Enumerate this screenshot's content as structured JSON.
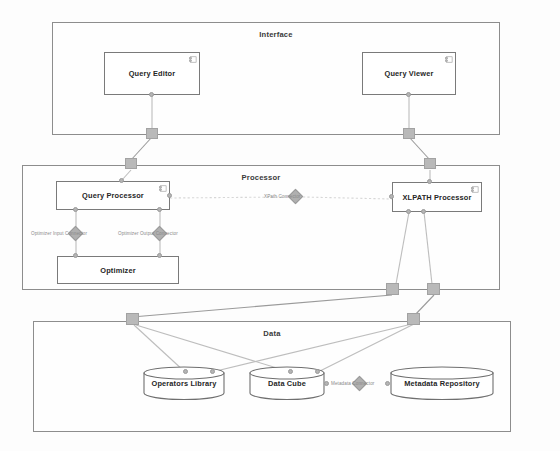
{
  "diagram": {
    "packages": [
      {
        "id": "interface",
        "label": "Interface"
      },
      {
        "id": "processor",
        "label": "Processor"
      },
      {
        "id": "data",
        "label": "Data"
      }
    ],
    "components": [
      {
        "id": "query-editor",
        "label": "Query Editor",
        "package": "interface"
      },
      {
        "id": "query-viewer",
        "label": "Query Viewer",
        "package": "interface"
      },
      {
        "id": "query-processor",
        "label": "Query Processor",
        "package": "processor"
      },
      {
        "id": "xlpath-processor",
        "label": "XLPATH Processor",
        "package": "processor"
      },
      {
        "id": "optimizer",
        "label": "Optimizer",
        "package": "processor"
      }
    ],
    "databases": [
      {
        "id": "operators-library",
        "label": "Operators Library",
        "package": "data"
      },
      {
        "id": "data-cube",
        "label": "Data Cube",
        "package": "data"
      },
      {
        "id": "metadata-repository",
        "label": "Metadata Repository",
        "package": "data"
      }
    ],
    "connectors": [
      {
        "id": "optimizer-input-connector",
        "label": "Optimizer Input Connector"
      },
      {
        "id": "optimizer-output-connector",
        "label": "Optimizer Output Connector"
      },
      {
        "id": "xpath-connector",
        "label": "XPath Connector"
      },
      {
        "id": "metadata-connector",
        "label": "Metadata Connector"
      }
    ],
    "colors": {
      "package_border": "#8d8d8d",
      "component_border": "#7a7a7a",
      "line": "#9a9a9a",
      "node_fill": "#b4b4b4",
      "text": "#262626",
      "connector_text": "#8a8a8a"
    }
  }
}
